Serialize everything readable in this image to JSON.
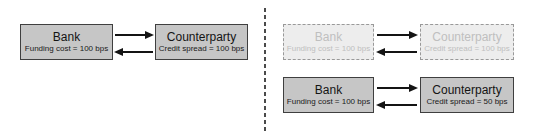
{
  "diagram": {
    "left_panel": {
      "bank": {
        "title": "Bank",
        "subtitle": "Funding cost = 100 bps"
      },
      "counterparty": {
        "title": "Counterparty",
        "subtitle": "Credit spread = 100 bps"
      }
    },
    "right_panel": {
      "faded_bank": {
        "title": "Bank",
        "subtitle": "Funding cost = 100 bps"
      },
      "faded_counterparty": {
        "title": "Counterparty",
        "subtitle": "Credit spread = 100 bps"
      },
      "solid_bank": {
        "title": "Bank",
        "subtitle": "Funding cost = 100 bps"
      },
      "solid_counterparty": {
        "title": "Counterparty",
        "subtitle": "Credit spread = 50 bps"
      }
    }
  },
  "colors": {
    "solid_fill": "#c6c6c6",
    "solid_border": "#3f3f3f",
    "faded_fill": "#ededed",
    "faded_border": "#999999",
    "faded_text": "#bfbfbf",
    "arrow": "#141414",
    "divider": "#4a4a4a"
  }
}
